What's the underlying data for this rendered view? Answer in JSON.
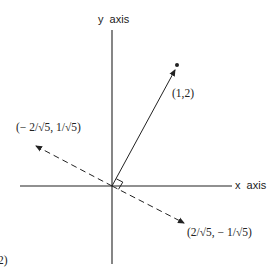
{
  "diagram": {
    "axes": {
      "y_label": "y  axis",
      "x_label": "x  axis"
    },
    "vectors": [
      {
        "label": "(1,2)",
        "style": "solid",
        "component": [
          1,
          2
        ]
      },
      {
        "label": "(− 2/√5, 1/√5)",
        "style": "dashed",
        "component": [
          "-2/sqrt5",
          "1/sqrt5"
        ]
      },
      {
        "label": "(2/√5, − 1/√5)",
        "style": "dashed",
        "component": [
          "2/sqrt5",
          "-1/sqrt5"
        ]
      }
    ],
    "cut_off_label": "2)",
    "colors": {
      "ink": "#222222",
      "background": "#ffffff"
    }
  }
}
